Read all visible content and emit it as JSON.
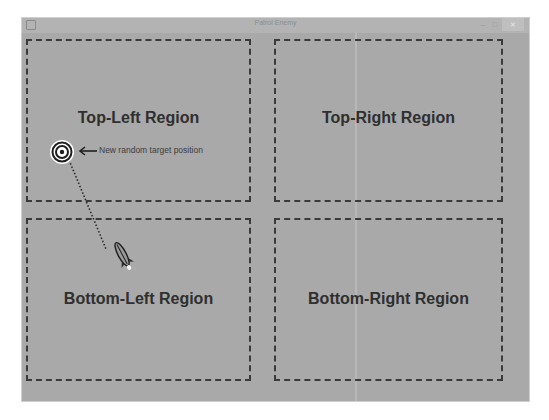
{
  "window": {
    "title": "Patrol Enemy",
    "controls": {
      "minimize": "–",
      "maximize": "□",
      "close": "✕"
    }
  },
  "regions": [
    {
      "id": "top-left",
      "label": "Top-Left Region"
    },
    {
      "id": "top-right",
      "label": "Top-Right Region"
    },
    {
      "id": "bottom-left",
      "label": "Bottom-Left Region"
    },
    {
      "id": "bottom-right",
      "label": "Bottom-Right Region"
    }
  ],
  "annotation": {
    "text": "New random target position",
    "icon": "arrow-left-icon"
  },
  "sprites": {
    "target": "bullseye-target-icon",
    "enemy": "rocket-ship-icon"
  },
  "colors": {
    "background": "#a9a9a9",
    "border": "#3a3a3a",
    "text": "#2f2f2f"
  }
}
